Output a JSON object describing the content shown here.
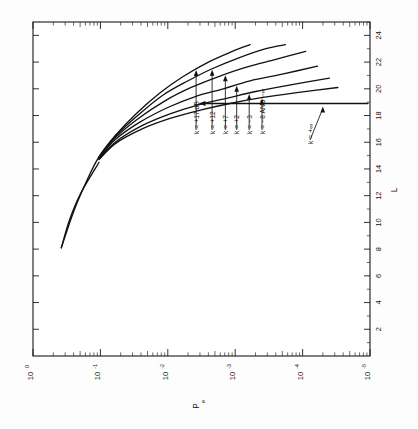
{
  "figure": {
    "orientation": "rotated-90-ccw",
    "background_color": "#fdfdfd",
    "ink_color": "#111111"
  },
  "chart_data": {
    "type": "line",
    "title": "",
    "subtitle": "",
    "xlabel": "P",
    "xlabel_sub": "e",
    "ylabel": "L",
    "xscale": "log",
    "yscale": "linear",
    "xlim": [
      1,
      1e-05
    ],
    "ylim": [
      0,
      25
    ],
    "grid": false,
    "legend_position": "in-plot-annotations",
    "x_tick_labels": [
      "10",
      "10",
      "10",
      "10",
      "10",
      "10"
    ],
    "x_tick_exponents": [
      "0",
      "-1",
      "-2",
      "-3",
      "-4",
      "-5"
    ],
    "x_tick_values": [
      1,
      0.1,
      0.01,
      0.001,
      0.0001,
      1e-05
    ],
    "y_tick_labels": [
      "2",
      "4",
      "6",
      "8",
      "10",
      "12",
      "14",
      "16",
      "18",
      "20",
      "22",
      "24"
    ],
    "y_tick_values": [
      2,
      4,
      6,
      8,
      10,
      12,
      14,
      16,
      18,
      20,
      22,
      24
    ],
    "annotations": [
      "k = +17 dB",
      "k = +12",
      "k = +7",
      "k = +2",
      "k = −3",
      "k = −8 AND −∞",
      "k = +∞"
    ],
    "series": [
      {
        "name": "k = +17 dB",
        "points": [
          [
            0.38,
            8.1
          ],
          [
            0.25,
            10.8
          ],
          [
            0.16,
            13.1
          ],
          [
            0.105,
            14.9
          ],
          [
            0.06,
            16.5
          ],
          [
            0.03,
            18.1
          ],
          [
            0.013,
            19.7
          ],
          [
            0.006,
            20.9
          ],
          [
            0.0025,
            22.0
          ],
          [
            0.0011,
            22.8
          ],
          [
            0.0006,
            23.3
          ]
        ]
      },
      {
        "name": "k = +12",
        "points": [
          [
            0.105,
            14.9
          ],
          [
            0.06,
            16.45
          ],
          [
            0.028,
            18.0
          ],
          [
            0.012,
            19.5
          ],
          [
            0.005,
            20.6
          ],
          [
            0.0022,
            21.5
          ],
          [
            0.0009,
            22.3
          ],
          [
            0.00035,
            23.0
          ],
          [
            0.00018,
            23.3
          ]
        ]
      },
      {
        "name": "k = +7",
        "points": [
          [
            0.105,
            14.85
          ],
          [
            0.06,
            16.35
          ],
          [
            0.027,
            17.8
          ],
          [
            0.011,
            19.1
          ],
          [
            0.0045,
            20.1
          ],
          [
            0.0018,
            20.9
          ],
          [
            0.0007,
            21.6
          ],
          [
            0.00025,
            22.2
          ],
          [
            9e-05,
            22.8
          ]
        ]
      },
      {
        "name": "k = +2",
        "points": [
          [
            0.105,
            14.8
          ],
          [
            0.06,
            16.2
          ],
          [
            0.026,
            17.5
          ],
          [
            0.01,
            18.6
          ],
          [
            0.004,
            19.4
          ],
          [
            0.0015,
            20.0
          ],
          [
            0.0006,
            20.6
          ],
          [
            0.0002,
            21.1
          ],
          [
            6e-05,
            21.7
          ]
        ]
      },
      {
        "name": "k = −3",
        "points": [
          [
            0.105,
            14.75
          ],
          [
            0.06,
            16.0
          ],
          [
            0.025,
            17.2
          ],
          [
            0.0095,
            18.1
          ],
          [
            0.0035,
            18.8
          ],
          [
            0.0013,
            19.3
          ],
          [
            0.0005,
            19.8
          ],
          [
            0.00015,
            20.3
          ],
          [
            4e-05,
            20.8
          ]
        ]
      },
      {
        "name": "k = −8 AND −∞",
        "points": [
          [
            0.105,
            14.7
          ],
          [
            0.06,
            15.9
          ],
          [
            0.024,
            17.0
          ],
          [
            0.009,
            17.8
          ],
          [
            0.0033,
            18.4
          ],
          [
            0.0012,
            18.9
          ],
          [
            0.00045,
            19.3
          ],
          [
            0.00013,
            19.7
          ],
          [
            3e-05,
            20.1
          ]
        ]
      },
      {
        "name": "k = +∞",
        "type": "horizontal-pointer",
        "value": 18.9,
        "points": [
          [
            1e-05,
            18.9
          ],
          [
            0.0012,
            18.9
          ]
        ]
      }
    ],
    "common_branch": {
      "description": "single merged low-L branch shared by all curves",
      "points": [
        [
          0.38,
          8.1
        ],
        [
          0.3,
          9.9
        ],
        [
          0.24,
          11.2
        ],
        [
          0.19,
          12.3
        ],
        [
          0.15,
          13.2
        ],
        [
          0.12,
          14.0
        ],
        [
          0.105,
          14.5
        ]
      ]
    }
  },
  "axes": {
    "left_axis_name": "P",
    "left_axis_sub": "e",
    "right_axis_name": "L"
  }
}
